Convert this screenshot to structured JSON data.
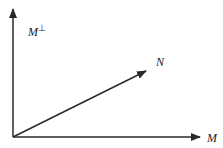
{
  "diagram": {
    "labels": {
      "m_perp": "M",
      "m_perp_sup": "⊥",
      "n": "N",
      "m": "M"
    },
    "colors": {
      "stroke": "#2a2a2a",
      "background": "#ffffff"
    },
    "vectors": [
      {
        "name": "M⊥",
        "from": [
          13,
          137
        ],
        "to": [
          13,
          8
        ]
      },
      {
        "name": "N",
        "from": [
          13,
          137
        ],
        "to": [
          147,
          70
        ]
      },
      {
        "name": "M",
        "from": [
          13,
          137
        ],
        "to": [
          201,
          137
        ]
      }
    ]
  }
}
